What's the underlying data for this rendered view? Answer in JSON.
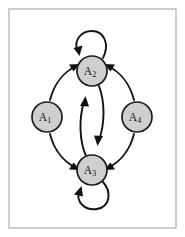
{
  "figure": {
    "type": "directed-graph",
    "background_color": "#ffffff",
    "frame": {
      "stroke_color": "#b9b9b9",
      "fill_color": "#ffffff",
      "x": 9,
      "y": 9,
      "width": 167,
      "height": 219
    },
    "node_style": {
      "fill_color": "#cfcfcf",
      "stroke_color": "#1c1c1c",
      "radius": 15
    },
    "edge_style": {
      "stroke_color": "#121212",
      "stroke_width": 1.9
    }
  },
  "nodes": [
    {
      "id": "A1",
      "base": "A",
      "subscript": "1",
      "cx": 47,
      "cy": 117,
      "r": 15
    },
    {
      "id": "A2",
      "base": "A",
      "subscript": "2",
      "cx": 92,
      "cy": 71,
      "r": 15
    },
    {
      "id": "A3",
      "base": "A",
      "subscript": "3",
      "cx": 92,
      "cy": 170,
      "r": 15
    },
    {
      "id": "A4",
      "base": "A",
      "subscript": "4",
      "cx": 137,
      "cy": 117,
      "r": 15
    }
  ],
  "edges": [
    {
      "id": "e-a1-a2",
      "from": "A1",
      "to": "A2",
      "kind": "curved",
      "direction": "A1 to A2"
    },
    {
      "id": "e-a1-a3",
      "from": "A1",
      "to": "A3",
      "kind": "curved",
      "direction": "A1 to A3"
    },
    {
      "id": "e-a4-a2",
      "from": "A4",
      "to": "A2",
      "kind": "curved",
      "direction": "A4 to A2"
    },
    {
      "id": "e-a4-a3",
      "from": "A4",
      "to": "A3",
      "kind": "curved",
      "direction": "A4 to A3"
    },
    {
      "id": "e-a3-a2",
      "from": "A3",
      "to": "A2",
      "kind": "curved",
      "direction": "A3 to A2"
    },
    {
      "id": "e-a2-a3",
      "from": "A2",
      "to": "A3",
      "kind": "curved",
      "direction": "A2 to A3"
    },
    {
      "id": "e-a2-a2",
      "from": "A2",
      "to": "A2",
      "kind": "self-loop",
      "direction": "A2 to A2",
      "placement": "above"
    },
    {
      "id": "e-a3-a3",
      "from": "A3",
      "to": "A3",
      "kind": "self-loop",
      "direction": "A3 to A3",
      "placement": "below"
    }
  ]
}
